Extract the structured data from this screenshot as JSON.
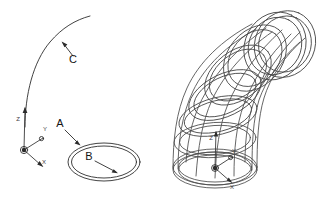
{
  "figure": {
    "background_color": "#ffffff",
    "line_color": "#4a4a4a",
    "label_color": "#141414",
    "width": 327,
    "height": 198
  },
  "callouts": [
    {
      "id": "A",
      "label": "A",
      "meaning": "outer profile ellipse",
      "text_x": 60,
      "text_y": 127,
      "leader_from_x": 65,
      "leader_from_y": 130,
      "leader_to_x": 80,
      "leader_to_y": 145
    },
    {
      "id": "B",
      "label": "B",
      "meaning": "inner profile ellipse",
      "text_x": 89,
      "text_y": 160,
      "leader_from_x": 95,
      "leader_from_y": 161,
      "leader_to_x": 117,
      "leader_to_y": 173
    },
    {
      "id": "C",
      "label": "C",
      "meaning": "sweep path curve",
      "text_x": 73,
      "text_y": 63,
      "leader_from_x": 73,
      "leader_from_y": 56,
      "leader_to_x": 62,
      "leader_to_y": 42
    }
  ],
  "axis_triads": [
    {
      "id": "profile-triad",
      "origin_x": 24,
      "origin_y": 150,
      "labels": {
        "x": "X",
        "y": "Y",
        "z": "Z"
      },
      "x_label_x": 44,
      "x_label_y": 162,
      "y_label_x": 45,
      "y_label_y": 130,
      "z_label_x": 18,
      "z_label_y": 121
    },
    {
      "id": "model-triad",
      "origin_x": 215,
      "origin_y": 168,
      "labels": {
        "x": "X",
        "y": "Y",
        "z": "Z"
      },
      "x_label_x": 231,
      "x_label_y": 180,
      "y_label_x": 233,
      "y_label_y": 153,
      "z_label_x": 211,
      "z_label_y": 139
    }
  ],
  "panels": [
    {
      "id": "profile-panel",
      "name": "profile-and-path",
      "description": "2D sweep inputs: concentric ellipse profile plus arc path"
    },
    {
      "id": "model-panel",
      "name": "swept-tube-model",
      "description": "3D wireframe result of sweeping the profile along the path"
    }
  ]
}
